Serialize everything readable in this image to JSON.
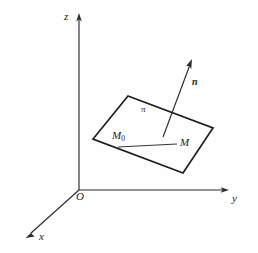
{
  "figure": {
    "background_color": "#fefefe",
    "stroke_color": "#1d1d1d",
    "width": 258,
    "height": 253
  },
  "axes": {
    "origin_label": "O",
    "x_label": "x",
    "y_label": "y",
    "z_label": "z",
    "origin": {
      "x": 79,
      "y": 190
    },
    "x_tip": {
      "x": 26,
      "y": 238
    },
    "y_tip": {
      "x": 228,
      "y": 190
    },
    "z_tip": {
      "x": 79,
      "y": 14
    }
  },
  "plane": {
    "label": "π",
    "label_pos": {
      "x": 141,
      "y": 105
    },
    "corners": [
      {
        "x": 128,
        "y": 96
      },
      {
        "x": 213,
        "y": 128
      },
      {
        "x": 183,
        "y": 173
      },
      {
        "x": 93,
        "y": 139
      }
    ]
  },
  "points": {
    "m0_label": "M",
    "m0_sub": "0",
    "m0_pos": {
      "x": 112,
      "y": 130
    },
    "m_label": "M",
    "m_pos": {
      "x": 180,
      "y": 137
    },
    "segment_start": {
      "x": 118,
      "y": 147
    },
    "segment_end": {
      "x": 177,
      "y": 144
    }
  },
  "normal": {
    "label": "n",
    "label_pos": {
      "x": 192,
      "y": 77
    },
    "tail": {
      "x": 163,
      "y": 137
    },
    "tip": {
      "x": 192,
      "y": 60
    }
  }
}
